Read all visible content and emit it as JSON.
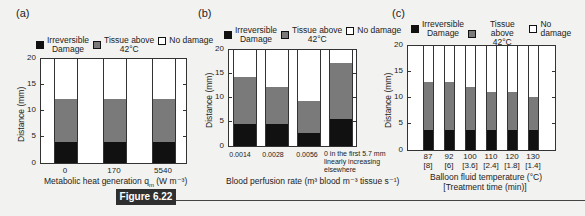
{
  "figure_badge": "Figure 6.22",
  "legend": {
    "irreversible": "Irreversible Damage",
    "irreversible_l1": "Irreversible",
    "irreversible_l2": "Damage",
    "tissue": "Tissue above 42°C",
    "tissue_l1": "Tissue above",
    "tissue_l2": "42°C",
    "none": "No damage"
  },
  "colors": {
    "irreversible": "#111111",
    "tissue": "#7a7a7a",
    "none": "#ffffff"
  },
  "panels": {
    "a": {
      "label": "(a)",
      "ylabel": "Distance (mm)",
      "xlabel": "Metabolic heat generation q",
      "xlabel_sub": "m",
      "xlabel_unit": " (W m⁻³)",
      "yticks": [
        "0",
        "5",
        "10",
        "15",
        "20"
      ],
      "xticks": [
        "0",
        "170",
        "5540"
      ]
    },
    "b": {
      "label": "(b)",
      "ylabel": "Distance (mm)",
      "xlabel": "Blood perfusion rate (m³ blood m⁻³ tissue s⁻¹)",
      "yticks": [
        "0",
        "5",
        "10",
        "15",
        "20"
      ],
      "xticks": [
        "0.0014",
        "0.0028",
        "0.0056"
      ],
      "xtick_last_l1": "0 in the first 5.7 mm",
      "xtick_last_l2": "linearly increasing",
      "xtick_last_l3": "elsewhere"
    },
    "c": {
      "label": "(c)",
      "ylabel": "Distance (mm)",
      "xlabel_l1": "Balloon fluid temperature (°C)",
      "xlabel_l2": "[Treatment time (min)]",
      "yticks": [
        "0",
        "5",
        "10",
        "15",
        "20"
      ],
      "xticks_top": [
        "87",
        "92",
        "100",
        "110",
        "120",
        "130"
      ],
      "xticks_bottom": [
        "[8]",
        "[6]",
        "[3.6]",
        "[2.4]",
        "[1.8]",
        "[1.4]"
      ]
    }
  },
  "chart_data": [
    {
      "type": "bar",
      "title": "(a)",
      "stacked": true,
      "categories": [
        "0",
        "170",
        "5540"
      ],
      "xlabel": "Metabolic heat generation q_m (W m^-3)",
      "ylabel": "Distance (mm)",
      "ylim": [
        0,
        20
      ],
      "series": [
        {
          "name": "Irreversible Damage",
          "values": [
            4.1,
            4.1,
            4.1
          ]
        },
        {
          "name": "Tissue above 42°C",
          "values": [
            8.2,
            8.2,
            8.2
          ]
        },
        {
          "name": "No damage",
          "values": [
            7.7,
            7.7,
            7.7
          ]
        }
      ],
      "totals_damage_plus_heated": [
        12.3,
        12.3,
        12.3
      ],
      "legend_position": "top"
    },
    {
      "type": "bar",
      "title": "(b)",
      "stacked": true,
      "categories": [
        "0.0014",
        "0.0028",
        "0.0056",
        "0 in the first 5.7 mm linearly increasing elsewhere"
      ],
      "xlabel": "Blood perfusion rate (m^3 blood m^-3 tissue s^-1)",
      "ylabel": "Distance (mm)",
      "ylim": [
        0,
        20
      ],
      "series": [
        {
          "name": "Irreversible Damage",
          "values": [
            4.6,
            4.5,
            2.8,
            5.6
          ]
        },
        {
          "name": "Tissue above 42°C",
          "values": [
            9.7,
            7.8,
            6.6,
            11.7
          ]
        },
        {
          "name": "No damage",
          "values": [
            5.7,
            7.7,
            10.6,
            2.7
          ]
        }
      ],
      "totals_damage_plus_heated": [
        14.3,
        12.3,
        9.4,
        17.3
      ],
      "legend_position": "top"
    },
    {
      "type": "bar",
      "title": "(c)",
      "stacked": true,
      "categories": [
        "87 [8]",
        "92 [6]",
        "100 [3.6]",
        "110 [2.4]",
        "120 [1.8]",
        "130 [1.4]"
      ],
      "xlabel": "Balloon fluid temperature (°C) [Treatment time (min)]",
      "ylabel": "Distance (mm)",
      "ylim": [
        0,
        20
      ],
      "series": [
        {
          "name": "Irreversible Damage",
          "values": [
            3.9,
            3.9,
            3.9,
            3.9,
            3.9,
            3.9
          ]
        },
        {
          "name": "Tissue above 42°C",
          "values": [
            9.1,
            9.1,
            8.2,
            7.2,
            7.3,
            6.3
          ]
        },
        {
          "name": "No damage",
          "values": [
            7.0,
            7.0,
            7.9,
            8.9,
            8.8,
            9.8
          ]
        }
      ],
      "totals_damage_plus_heated": [
        13.0,
        13.0,
        12.1,
        11.1,
        11.2,
        10.2
      ],
      "legend_position": "top"
    }
  ]
}
